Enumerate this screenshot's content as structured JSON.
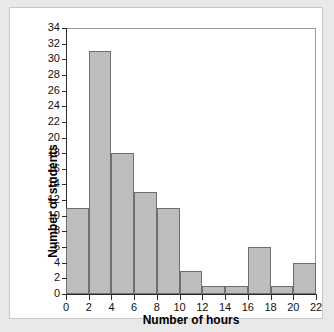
{
  "chart_data": {
    "type": "bar",
    "title": "",
    "xlabel": "Number of hours",
    "ylabel": "Number of students",
    "categories": [
      "0-2",
      "2-4",
      "4-6",
      "6-8",
      "8-10",
      "10-12",
      "12-14",
      "14-16",
      "16-18",
      "18-20",
      "20-22"
    ],
    "bin_edges": [
      0,
      2,
      4,
      6,
      8,
      10,
      12,
      14,
      16,
      18,
      20,
      22
    ],
    "values": [
      11,
      31,
      18,
      13,
      11,
      3,
      1,
      1,
      6,
      1,
      4
    ],
    "xlim": [
      0,
      22
    ],
    "ylim": [
      0,
      34
    ],
    "xticks": [
      0,
      2,
      4,
      6,
      8,
      10,
      12,
      14,
      16,
      18,
      20,
      22
    ],
    "yticks": [
      0,
      2,
      4,
      6,
      8,
      10,
      12,
      14,
      16,
      18,
      20,
      22,
      24,
      26,
      28,
      30,
      32,
      34
    ],
    "xtick_labels": [
      "0",
      "2",
      "4",
      "6",
      "8",
      "10",
      "12",
      "14",
      "16",
      "18",
      "20",
      "22"
    ],
    "ytick_labels": [
      "0",
      "2",
      "4",
      "6",
      "8",
      "10",
      "12",
      "14",
      "16",
      "18",
      "20",
      "22",
      "24",
      "26",
      "28",
      "30",
      "32",
      "34"
    ],
    "grid": false,
    "legend": null,
    "bar_color": "#bdbdbd",
    "bar_border_color": "#6f6f6f",
    "axis_color": "#2b2b2b",
    "plot_background": "#ffffff",
    "page_background": "#e9e9e9"
  }
}
